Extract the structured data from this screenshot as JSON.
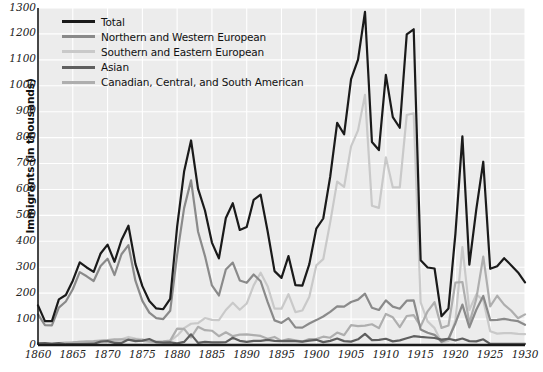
{
  "chart_data": {
    "type": "line",
    "title": "",
    "xlabel": "",
    "ylabel": "Immigrants (in thousands)",
    "xlim": [
      1860,
      1930
    ],
    "ylim": [
      0,
      1300
    ],
    "ytick_step": 100,
    "xtick_step": 5,
    "grid": true,
    "legend_position": "top-left",
    "xticks": [
      "1860",
      "1865",
      "1870",
      "1875",
      "1880",
      "1885",
      "1890",
      "1895",
      "1900",
      "1905",
      "1910",
      "1915",
      "1920",
      "1925",
      "1930"
    ],
    "yticks": [
      "0",
      "100",
      "200",
      "300",
      "400",
      "500",
      "600",
      "700",
      "800",
      "900",
      "1000",
      "1100",
      "1200",
      "1300"
    ],
    "x": [
      1860,
      1861,
      1862,
      1863,
      1864,
      1865,
      1866,
      1867,
      1868,
      1869,
      1870,
      1871,
      1872,
      1873,
      1874,
      1875,
      1876,
      1877,
      1878,
      1879,
      1880,
      1881,
      1882,
      1883,
      1884,
      1885,
      1886,
      1887,
      1888,
      1889,
      1890,
      1891,
      1892,
      1893,
      1894,
      1895,
      1896,
      1897,
      1898,
      1899,
      1900,
      1901,
      1902,
      1903,
      1904,
      1905,
      1906,
      1907,
      1908,
      1909,
      1910,
      1911,
      1912,
      1913,
      1914,
      1915,
      1916,
      1917,
      1918,
      1919,
      1920,
      1921,
      1922,
      1923,
      1924,
      1925,
      1926,
      1927,
      1928,
      1929,
      1930
    ],
    "series": [
      {
        "name": "Total",
        "color": "#1a1a1a",
        "width": 2.2,
        "values": [
          153,
          92,
          92,
          176,
          193,
          248,
          319,
          299,
          282,
          353,
          387,
          321,
          405,
          460,
          313,
          227,
          170,
          141,
          138,
          178,
          457,
          669,
          789,
          603,
          519,
          395,
          334,
          490,
          547,
          444,
          455,
          560,
          580,
          440,
          285,
          259,
          343,
          231,
          229,
          312,
          449,
          488,
          649,
          857,
          813,
          1026,
          1101,
          1285,
          783,
          752,
          1042,
          879,
          838,
          1198,
          1218,
          327,
          299,
          295,
          111,
          141,
          430,
          805,
          310,
          523,
          707,
          294,
          304,
          335,
          308,
          280,
          242
        ]
      },
      {
        "name": "Northern and Western European",
        "color": "#8a8a8a",
        "width": 2.2,
        "values": [
          118,
          77,
          76,
          144,
          168,
          215,
          281,
          265,
          247,
          305,
          333,
          270,
          350,
          385,
          248,
          170,
          125,
          104,
          100,
          132,
          348,
          528,
          635,
          438,
          343,
          230,
          191,
          291,
          318,
          249,
          240,
          272,
          246,
          166,
          95,
          85,
          104,
          68,
          67,
          83,
          96,
          110,
          128,
          149,
          148,
          166,
          175,
          198,
          144,
          135,
          172,
          148,
          140,
          171,
          172,
          60,
          47,
          39,
          13,
          24,
          84,
          156,
          68,
          136,
          189,
          96,
          97,
          101,
          96,
          92,
          78
        ]
      },
      {
        "name": "Southern and Eastern European",
        "color": "#c9c9c9",
        "width": 2.2,
        "values": [
          6,
          3,
          3,
          5,
          6,
          9,
          12,
          11,
          12,
          15,
          18,
          16,
          22,
          31,
          25,
          22,
          15,
          11,
          12,
          16,
          36,
          65,
          82,
          84,
          104,
          97,
          96,
          135,
          163,
          136,
          160,
          230,
          279,
          227,
          140,
          140,
          196,
          127,
          133,
          186,
          307,
          331,
          473,
          630,
          610,
          766,
          828,
          965,
          537,
          529,
          724,
          608,
          608,
          887,
          894,
          164,
          91,
          65,
          10,
          16,
          95,
          378,
          135,
          195,
          173,
          53,
          44,
          46,
          46,
          43,
          42
        ]
      },
      {
        "name": "Asian",
        "color": "#5f5f5f",
        "width": 2.2,
        "values": [
          6,
          7,
          4,
          7,
          3,
          3,
          3,
          4,
          5,
          13,
          15,
          8,
          8,
          21,
          15,
          17,
          23,
          11,
          9,
          10,
          6,
          12,
          41,
          8,
          12,
          10,
          10,
          11,
          28,
          16,
          12,
          16,
          16,
          20,
          16,
          15,
          16,
          15,
          13,
          17,
          20,
          11,
          16,
          25,
          15,
          13,
          22,
          43,
          19,
          20,
          24,
          14,
          18,
          26,
          34,
          31,
          29,
          27,
          21,
          24,
          18,
          25,
          15,
          14,
          22,
          4,
          4,
          4,
          4,
          4,
          4
        ]
      },
      {
        "name": "Canadian, Central, and South American",
        "color": "#aeaeae",
        "width": 2.2,
        "values": [
          5,
          5,
          5,
          7,
          9,
          10,
          12,
          14,
          15,
          17,
          19,
          22,
          22,
          20,
          22,
          16,
          13,
          13,
          14,
          17,
          63,
          62,
          29,
          70,
          57,
          55,
          34,
          49,
          34,
          40,
          41,
          38,
          35,
          24,
          31,
          16,
          23,
          18,
          13,
          23,
          23,
          32,
          28,
          48,
          38,
          77,
          73,
          75,
          80,
          65,
          120,
          107,
          69,
          112,
          115,
          72,
          130,
          165,
          66,
          75,
          241,
          243,
          85,
          178,
          341,
          149,
          190,
          156,
          133,
          103,
          118
        ]
      }
    ]
  }
}
